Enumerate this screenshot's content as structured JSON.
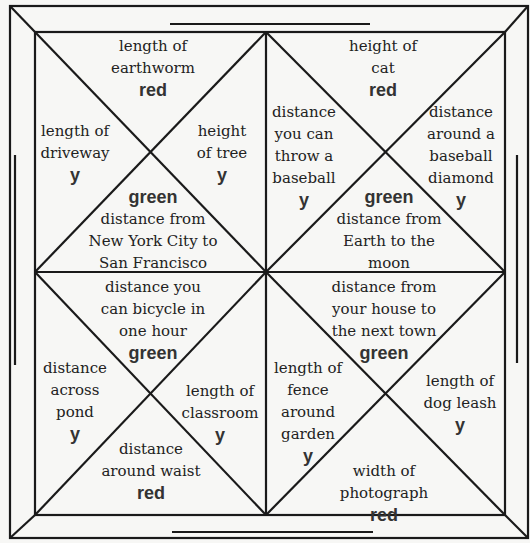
{
  "puzzle": {
    "cells": [
      {
        "id": "tl-top",
        "lines": [
          "length of",
          "earthworm"
        ],
        "tag": "red",
        "tag_pos": "after",
        "x": 153,
        "y": 35
      },
      {
        "id": "tl-left",
        "lines": [
          "length of",
          "driveway"
        ],
        "tag": "y",
        "tag_pos": "after",
        "x": 75,
        "y": 120
      },
      {
        "id": "tl-right",
        "lines": [
          "height",
          "of tree"
        ],
        "tag": "y",
        "tag_pos": "after",
        "x": 222,
        "y": 120
      },
      {
        "id": "tl-bottom",
        "lines": [
          "distance from",
          "New York City to",
          "San Francisco"
        ],
        "tag": "green",
        "tag_pos": "before",
        "x": 153,
        "y": 186
      },
      {
        "id": "tr-top",
        "lines": [
          "height of",
          "cat"
        ],
        "tag": "red",
        "tag_pos": "after",
        "x": 383,
        "y": 35
      },
      {
        "id": "tr-left",
        "lines": [
          "distance",
          "you can",
          "throw a",
          "baseball"
        ],
        "tag": "y",
        "tag_pos": "after",
        "x": 304,
        "y": 101
      },
      {
        "id": "tr-right",
        "lines": [
          "distance",
          "around a",
          "baseball",
          "diamond"
        ],
        "tag": "y",
        "tag_pos": "after",
        "x": 461,
        "y": 101
      },
      {
        "id": "tr-bottom",
        "lines": [
          "distance from",
          "Earth to the",
          "moon"
        ],
        "tag": "green",
        "tag_pos": "before",
        "x": 389,
        "y": 186
      },
      {
        "id": "bl-top",
        "lines": [
          "distance you",
          "can bicycle in",
          "one hour"
        ],
        "tag": "green",
        "tag_pos": "after",
        "x": 153,
        "y": 276
      },
      {
        "id": "bl-left",
        "lines": [
          "distance",
          "across",
          "pond"
        ],
        "tag": "y",
        "tag_pos": "after",
        "x": 75,
        "y": 357
      },
      {
        "id": "bl-right",
        "lines": [
          "length of",
          "classroom"
        ],
        "tag": "y",
        "tag_pos": "after",
        "x": 220,
        "y": 380
      },
      {
        "id": "bl-bottom",
        "lines": [
          "distance",
          "around waist"
        ],
        "tag": "red",
        "tag_pos": "after",
        "x": 151,
        "y": 438
      },
      {
        "id": "br-top",
        "lines": [
          "distance from",
          "your house to",
          "the next town"
        ],
        "tag": "green",
        "tag_pos": "after",
        "x": 384,
        "y": 276
      },
      {
        "id": "br-left",
        "lines": [
          "length of",
          "fence",
          "around",
          "garden"
        ],
        "tag": "y",
        "tag_pos": "after",
        "x": 308,
        "y": 357
      },
      {
        "id": "br-right",
        "lines": [
          "length of",
          "dog leash"
        ],
        "tag": "y",
        "tag_pos": "after",
        "x": 460,
        "y": 370
      },
      {
        "id": "br-bottom",
        "lines": [
          "width of",
          "photograph"
        ],
        "tag": "red",
        "tag_pos": "after",
        "x": 384,
        "y": 460
      }
    ]
  }
}
